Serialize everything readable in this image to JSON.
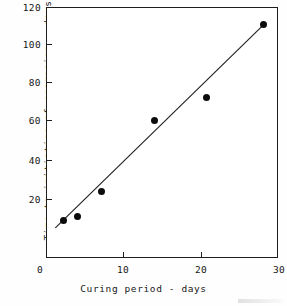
{
  "chart_data": {
    "type": "scatter",
    "title": "",
    "xlabel": "Curing period - days",
    "ylabel": "Time to initiation of corrosion - days",
    "xlim": [
      0,
      30
    ],
    "ylim": [
      -10,
      120
    ],
    "xticks": [
      0,
      10,
      20,
      30
    ],
    "yticks": [
      20,
      40,
      60,
      80,
      100,
      120
    ],
    "xtick_labels": [
      "0",
      "10",
      "20",
      "30"
    ],
    "ytick_labels": [
      "20",
      "40",
      "60",
      "80",
      "100",
      "120"
    ],
    "grid": false,
    "legend": false,
    "marker": "filled-circle",
    "marker_color": "#0c0c0c",
    "line_color": "#1d1d1d",
    "points": [
      {
        "x": 2.3,
        "y": 9
      },
      {
        "x": 4.0,
        "y": 11
      },
      {
        "x": 7.2,
        "y": 24
      },
      {
        "x": 14.0,
        "y": 61
      },
      {
        "x": 20.7,
        "y": 73
      },
      {
        "x": 28.0,
        "y": 111
      }
    ],
    "fit_line": {
      "type": "linear-trend",
      "x_start": 1.2,
      "y_start": 5,
      "x_end": 28.2,
      "y_end": 111.5
    }
  },
  "axes": {
    "y_title": "Time to initiation of corrosion - days",
    "x_title": "Curing period - days",
    "origin_label": "0"
  }
}
